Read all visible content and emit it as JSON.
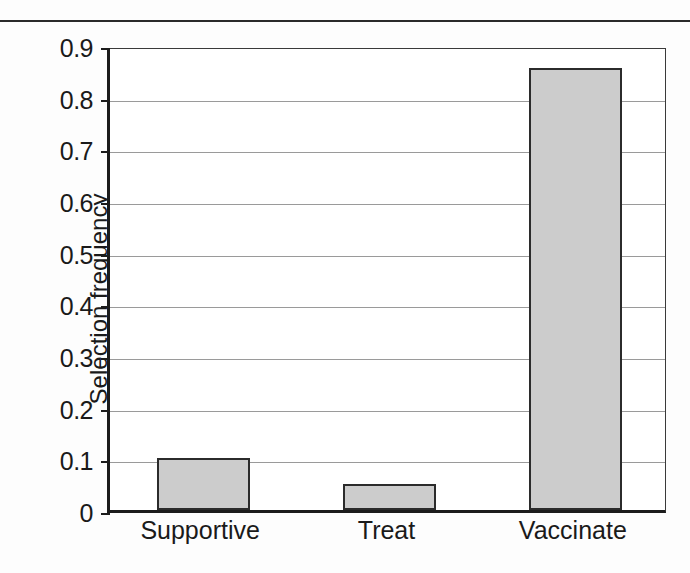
{
  "chart_data": {
    "type": "bar",
    "title": "",
    "xlabel": "",
    "ylabel": "Selection frequency",
    "categories": [
      "Supportive",
      "Treat",
      "Vaccinate"
    ],
    "values": [
      0.1,
      0.05,
      0.855
    ],
    "ylim": [
      0,
      0.9
    ],
    "ytick_labels": [
      "0",
      "0.1",
      "0.2",
      "0.3",
      "0.4",
      "0.5",
      "0.6",
      "0.7",
      "0.8",
      "0.9"
    ],
    "ytick_values": [
      0,
      0.1,
      0.2,
      0.3,
      0.4,
      0.5,
      0.6,
      0.7,
      0.8,
      0.9
    ],
    "grid": true,
    "legend": null,
    "bar_fill_color": "#cccccc",
    "bar_border_color": "#2b2b2b",
    "gridline_color": "#9a9a9a",
    "axis_color": "#1c1c1c"
  }
}
